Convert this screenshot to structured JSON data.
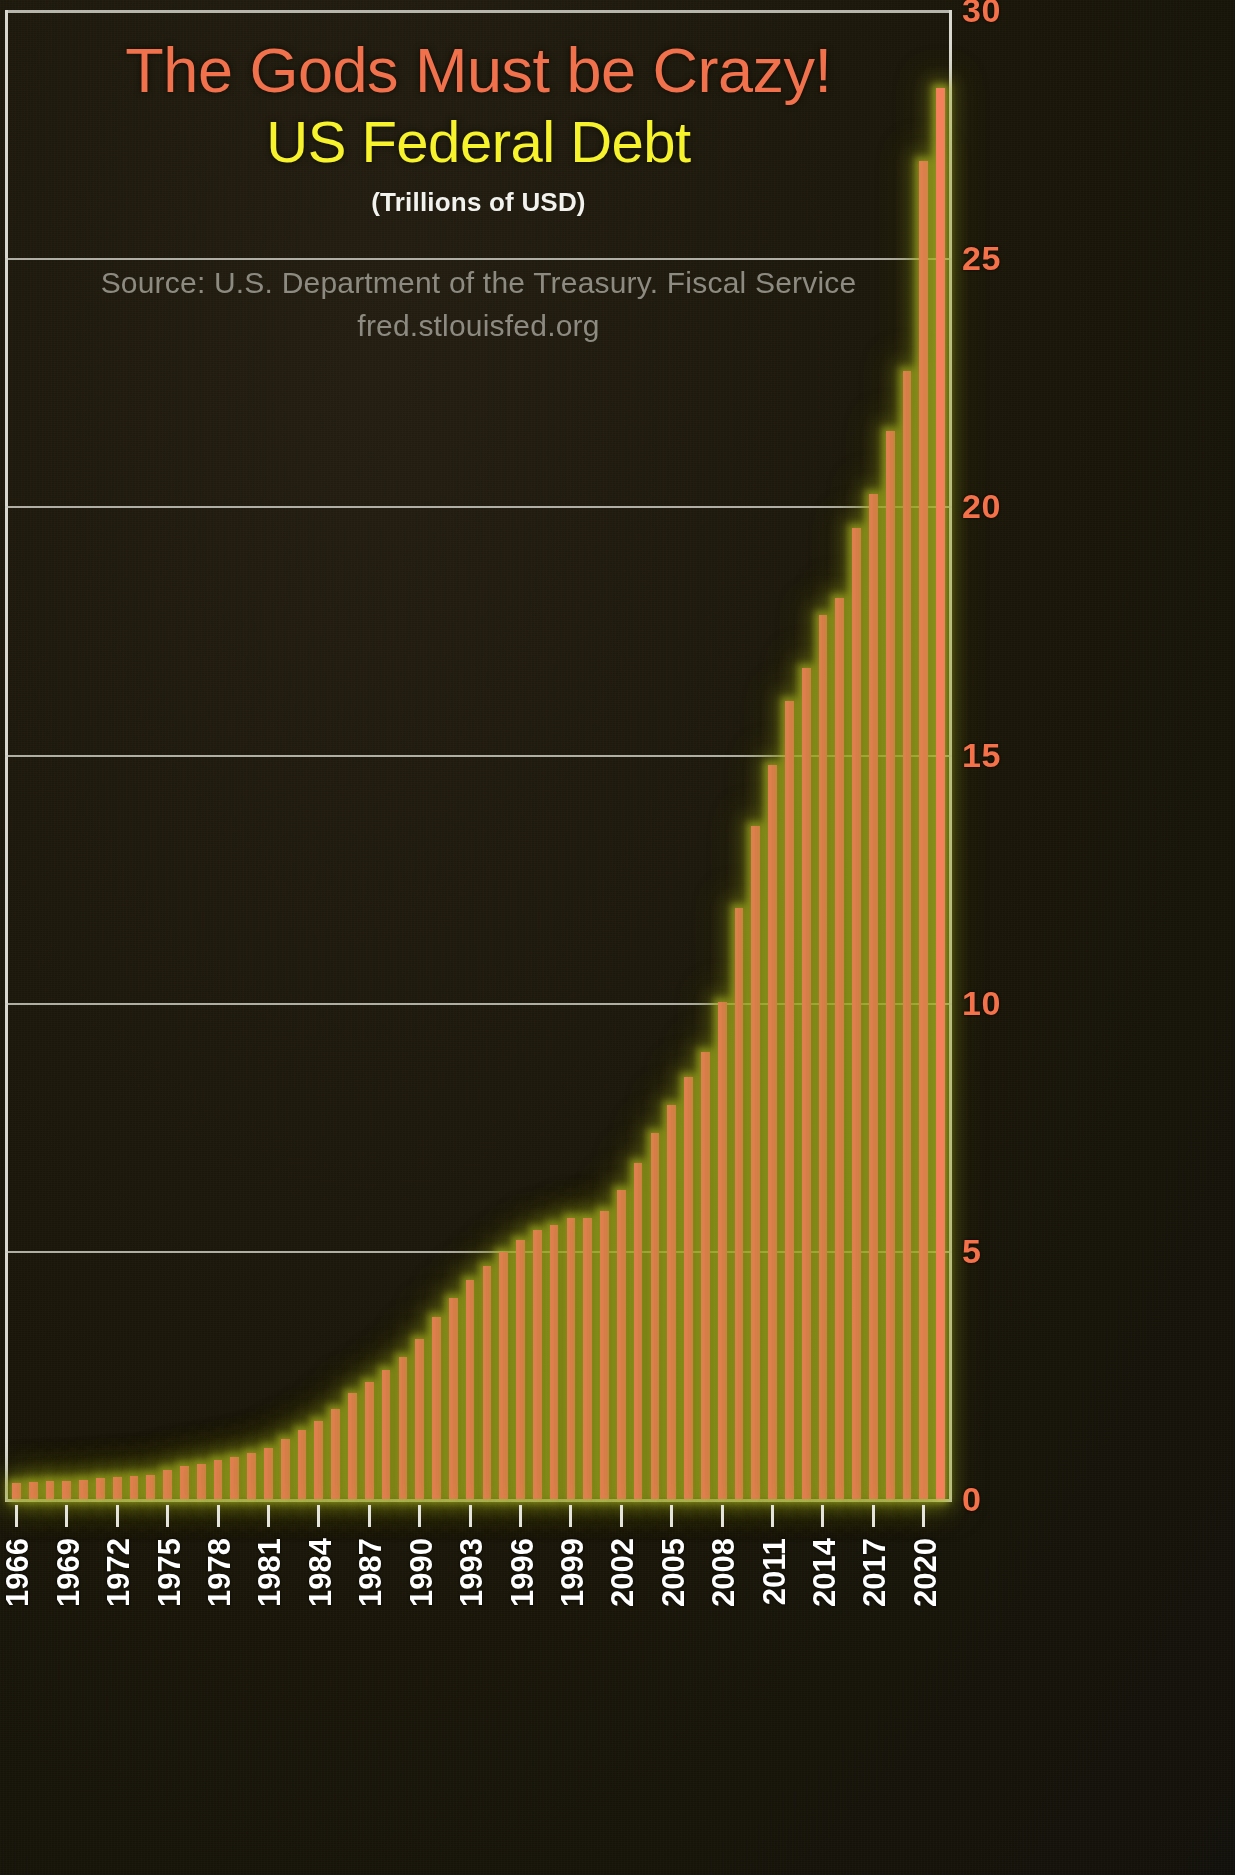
{
  "titles": {
    "main": "The Gods Must be Crazy!",
    "sub": "US Federal Debt",
    "units": "(Trillions of USD)",
    "source_line1": "Source: U.S. Department of the Treasury. Fiscal Service",
    "source_line2": "fred.stlouisfed.org"
  },
  "colors": {
    "title_main": "#f0714c",
    "title_sub": "#f6f22c",
    "units": "#f2f2ee",
    "source": "#8d8a82",
    "bar": "#f4805b",
    "bar_glow": "#bec828",
    "y_label": "#f4714a",
    "x_label": "#ffffff",
    "gridline": "#cfcfc6",
    "background": "#181509"
  },
  "chart_data": {
    "type": "bar",
    "title": "The Gods Must be Crazy! US Federal Debt",
    "subtitle": "(Trillions of USD)",
    "xlabel": "",
    "ylabel": "",
    "ylim": [
      0,
      30
    ],
    "yticks": [
      0,
      5,
      10,
      15,
      20,
      25,
      30
    ],
    "ytick_labels": [
      "0",
      "5",
      "10",
      "15",
      "20",
      "25",
      "30"
    ],
    "grid": true,
    "legend": "none",
    "xtick_labels": [
      "1966",
      "1969",
      "1972",
      "1975",
      "1978",
      "1981",
      "1984",
      "1987",
      "1990",
      "1993",
      "1996",
      "1999",
      "2002",
      "2005",
      "2008",
      "2011",
      "2014",
      "2017",
      "2020"
    ],
    "xtick_years": [
      1966,
      1969,
      1972,
      1975,
      1978,
      1981,
      1984,
      1987,
      1990,
      1993,
      1996,
      1999,
      2002,
      2005,
      2008,
      2011,
      2014,
      2017,
      2020
    ],
    "categories": [
      1966,
      1967,
      1968,
      1969,
      1970,
      1971,
      1972,
      1973,
      1974,
      1975,
      1976,
      1977,
      1978,
      1979,
      1980,
      1981,
      1982,
      1983,
      1984,
      1985,
      1986,
      1987,
      1988,
      1989,
      1990,
      1991,
      1992,
      1993,
      1994,
      1995,
      1996,
      1997,
      1998,
      1999,
      2000,
      2001,
      2002,
      2003,
      2004,
      2005,
      2006,
      2007,
      2008,
      2009,
      2010,
      2011,
      2012,
      2013,
      2014,
      2015,
      2016,
      2017,
      2018,
      2019,
      2020,
      2021
    ],
    "values": [
      0.32,
      0.34,
      0.37,
      0.37,
      0.39,
      0.42,
      0.45,
      0.47,
      0.49,
      0.58,
      0.67,
      0.71,
      0.79,
      0.85,
      0.93,
      1.03,
      1.2,
      1.4,
      1.58,
      1.82,
      2.13,
      2.35,
      2.6,
      2.87,
      3.23,
      3.67,
      4.06,
      4.41,
      4.69,
      4.97,
      5.22,
      5.41,
      5.53,
      5.66,
      5.67,
      5.81,
      6.23,
      6.78,
      7.38,
      7.93,
      8.51,
      9.01,
      10.02,
      11.91,
      13.56,
      14.79,
      16.07,
      16.74,
      17.82,
      18.15,
      19.57,
      20.24,
      21.52,
      22.72,
      26.95,
      28.43
    ]
  }
}
